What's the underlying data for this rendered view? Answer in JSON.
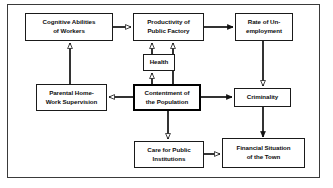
{
  "diagram": {
    "frame": {
      "border_color": "#3a3a3a"
    },
    "node_colors": {
      "border": "#1a1a1a",
      "emphasis_border": "#000000",
      "fill": "#ffffff",
      "text": "#0d0d0d"
    },
    "nodes": [
      {
        "id": "cognitive-abilities",
        "label": "Cognitive Abilities\nof Workers",
        "x": 25,
        "y": 13,
        "w": 88,
        "h": 28,
        "emphasis": false
      },
      {
        "id": "productivity",
        "label": "Productivity of\nPublic Factory",
        "x": 133,
        "y": 13,
        "w": 71,
        "h": 28,
        "emphasis": false
      },
      {
        "id": "unemployment",
        "label": "Rate of Un-\nemployment",
        "x": 235,
        "y": 13,
        "w": 58,
        "h": 28,
        "emphasis": false
      },
      {
        "id": "health",
        "label": "Health",
        "x": 143,
        "y": 54,
        "w": 32,
        "h": 17,
        "emphasis": false
      },
      {
        "id": "parental-supervision",
        "label": "Parental Home-\nWork Supervision",
        "x": 36,
        "y": 84,
        "w": 71,
        "h": 27,
        "emphasis": false
      },
      {
        "id": "contentment",
        "label": "Contentment of\nthe Population",
        "x": 133,
        "y": 84,
        "w": 68,
        "h": 27,
        "emphasis": true
      },
      {
        "id": "criminality",
        "label": "Criminality",
        "x": 234,
        "y": 88,
        "w": 57,
        "h": 19,
        "emphasis": false
      },
      {
        "id": "care-public-institutions",
        "label": "Care for Public\nInstitutions",
        "x": 134,
        "y": 141,
        "w": 70,
        "h": 27,
        "emphasis": false
      },
      {
        "id": "financial-situation",
        "label": "Financial Situation\nof the Town",
        "x": 222,
        "y": 138,
        "w": 83,
        "h": 30,
        "emphasis": false
      }
    ],
    "edges": [
      {
        "id": "cognitive-to-productivity",
        "from": "cognitive-abilities",
        "to": "productivity",
        "head": "hollow",
        "direction": "right"
      },
      {
        "id": "productivity-to-unemployment",
        "from": "productivity",
        "to": "unemployment",
        "head": "filled",
        "direction": "right"
      },
      {
        "id": "health-to-productivity",
        "from": "health",
        "to": "productivity",
        "head": "hollow",
        "direction": "up"
      },
      {
        "id": "contentment-to-health",
        "from": "contentment",
        "to": "health",
        "head": "hollow",
        "direction": "up"
      },
      {
        "id": "contentment-to-productivity",
        "from": "contentment",
        "to": "productivity",
        "head": "hollow",
        "direction": "up"
      },
      {
        "id": "parental-to-cognitive",
        "from": "parental-supervision",
        "to": "cognitive-abilities",
        "head": "hollow",
        "direction": "up"
      },
      {
        "id": "contentment-to-parental",
        "from": "contentment",
        "to": "parental-supervision",
        "head": "hollow",
        "direction": "left"
      },
      {
        "id": "contentment-to-criminality",
        "from": "contentment",
        "to": "criminality",
        "head": "filled",
        "direction": "right"
      },
      {
        "id": "unemployment-to-criminality",
        "from": "unemployment",
        "to": "criminality",
        "head": "hollow",
        "direction": "down"
      },
      {
        "id": "criminality-to-financial",
        "from": "criminality",
        "to": "financial-situation",
        "head": "filled",
        "direction": "down"
      },
      {
        "id": "contentment-to-care",
        "from": "contentment",
        "to": "care-public-institutions",
        "head": "hollow",
        "direction": "down"
      },
      {
        "id": "care-to-financial",
        "from": "care-public-institutions",
        "to": "financial-situation",
        "head": "hollow",
        "direction": "right"
      }
    ]
  }
}
